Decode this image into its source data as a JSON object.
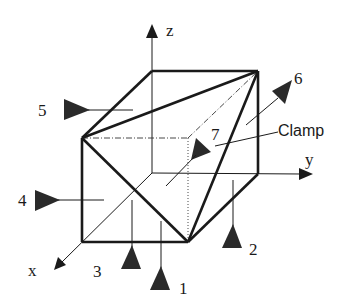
{
  "diagram": {
    "axes": {
      "x": "x",
      "y": "y",
      "z": "z"
    },
    "callout": "Clamp",
    "locators": [
      {
        "id": "1",
        "label": "1"
      },
      {
        "id": "2",
        "label": "2"
      },
      {
        "id": "3",
        "label": "3"
      },
      {
        "id": "4",
        "label": "4"
      },
      {
        "id": "5",
        "label": "5"
      },
      {
        "id": "6",
        "label": "6"
      },
      {
        "id": "7",
        "label": "7"
      }
    ],
    "colors": {
      "line": "#1a1a1a",
      "arrow_fill": "#2a2a2a",
      "background": "#ffffff"
    }
  }
}
